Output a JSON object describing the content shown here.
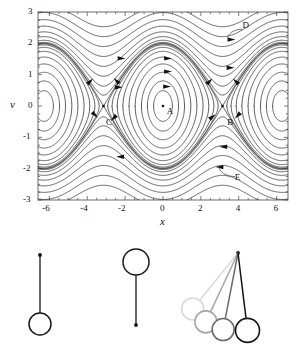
{
  "figure": {
    "phase_portrait": {
      "frame": {
        "x0": 38,
        "y0": 12,
        "x1": 288,
        "y1": 200
      },
      "xaxis": {
        "label": "x",
        "min": -6.6,
        "max": 6.6,
        "ticks": [
          -6,
          -4,
          -2,
          0,
          2,
          4,
          6
        ],
        "tick_labels": [
          "-6",
          "-4",
          "-2",
          "0",
          "2",
          "4",
          "6"
        ],
        "minor_step": 0.5
      },
      "yaxis": {
        "label": "v",
        "min": -3,
        "max": 3,
        "ticks": [
          3,
          2,
          1,
          0,
          -1,
          -2,
          -3
        ],
        "tick_labels": [
          "3",
          "2",
          "1",
          "0",
          "-1",
          "-2",
          "-3"
        ],
        "minor_step": 0.25
      },
      "annotations": [
        {
          "id": "A",
          "label": "A",
          "x": 0.35,
          "y": -0.18,
          "marker_x": 0.0,
          "marker_y": 0.0,
          "kind": "center-fixed-point"
        },
        {
          "id": "B",
          "label": "B",
          "x": 3.55,
          "y": -0.55,
          "marker_x": 3.1416,
          "marker_y": 0.0,
          "kind": "saddle-fixed-point"
        },
        {
          "id": "C",
          "label": "C",
          "x": -2.85,
          "y": -0.55,
          "marker_x": -3.1416,
          "marker_y": 0.0,
          "kind": "saddle-fixed-point"
        },
        {
          "id": "D",
          "label": "D",
          "x": 4.35,
          "y": 2.55,
          "kind": "rotating-orbit-callout"
        },
        {
          "id": "E",
          "label": "E",
          "x": 3.95,
          "y": -2.3,
          "kind": "rotating-orbit-callout"
        }
      ],
      "separatrix_energy": 2.0,
      "caption_note": "pendulum phase portrait"
    },
    "pendulums": [
      {
        "id": "p1",
        "name": "hanging-pendulum",
        "pivot": [
          40,
          255
        ],
        "bob": [
          40,
          324
        ],
        "bob_r": 11,
        "color": "#1a1a1a"
      },
      {
        "id": "p2",
        "name": "inverted-pendulum",
        "pivot": [
          136,
          325
        ],
        "bob": [
          136,
          262
        ],
        "bob_r": 13,
        "color": "#1a1a1a"
      },
      {
        "id": "p3",
        "name": "swinging-pendulum-sequence",
        "pivot": [
          238,
          253
        ],
        "arms": [
          {
            "angle_deg": -39,
            "length": 72,
            "bob_r": 11,
            "color": "#d9d9d9"
          },
          {
            "angle_deg": -25,
            "length": 76,
            "bob_r": 11,
            "color": "#a6a6a6"
          },
          {
            "angle_deg": -11,
            "length": 78,
            "bob_r": 11,
            "color": "#6b6b6b"
          },
          {
            "angle_deg": 7,
            "length": 78,
            "bob_r": 12,
            "color": "#141414"
          }
        ]
      }
    ],
    "colors": {
      "ink": "#1a1a1a",
      "frame": "#5a5a5a",
      "curve": "#2b2b2b"
    }
  }
}
